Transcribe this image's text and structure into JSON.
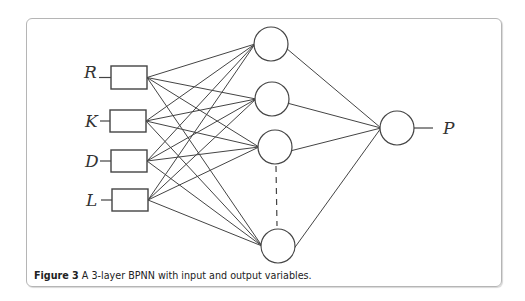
{
  "figure": {
    "caption_label": "Figure 3",
    "caption_text": " A 3-layer BPNN with input and output variables."
  },
  "network": {
    "inputs": [
      {
        "label": "R",
        "label_x": 84,
        "label_y": 78,
        "box": [
          111,
          66,
          36,
          23
        ]
      },
      {
        "label": "K",
        "label_x": 85,
        "label_y": 127,
        "box": [
          110,
          110,
          36,
          22
        ]
      },
      {
        "label": "D",
        "label_x": 85,
        "label_y": 167,
        "box": [
          111,
          150,
          36,
          22
        ]
      },
      {
        "label": "L",
        "label_x": 86,
        "label_y": 206,
        "box": [
          112,
          189,
          36,
          22
        ]
      }
    ],
    "hidden": [
      {
        "cx": 271,
        "cy": 44,
        "r": 17
      },
      {
        "cx": 272,
        "cy": 99,
        "r": 17
      },
      {
        "cx": 275,
        "cy": 147,
        "r": 17
      },
      {
        "cx": 278,
        "cy": 246,
        "r": 17
      }
    ],
    "hidden_ellipsis": "dashed",
    "output": {
      "label": "P",
      "cx": 397,
      "cy": 128,
      "r": 17,
      "label_x": 443,
      "label_y": 134
    }
  }
}
